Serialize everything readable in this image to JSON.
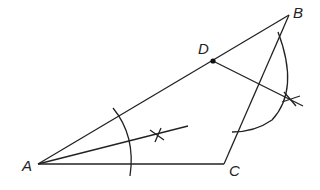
{
  "figure": {
    "type": "geometric-construction",
    "points": {
      "A": {
        "label": "A",
        "x": 38,
        "y": 164
      },
      "B": {
        "label": "B",
        "x": 289,
        "y": 15
      },
      "C": {
        "label": "C",
        "x": 224,
        "y": 164
      },
      "D": {
        "label": "D",
        "x": 213,
        "y": 61
      }
    },
    "segments": [
      "AB",
      "AC",
      "BC",
      "D-perpendicular",
      "A-angle-bisector"
    ],
    "stroke_color": "#222222"
  }
}
